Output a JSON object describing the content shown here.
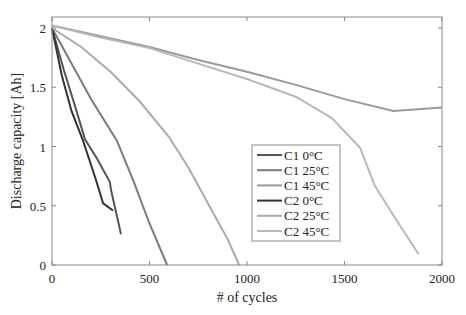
{
  "chart_data": {
    "type": "line",
    "title": "",
    "xlabel": "# of cycles",
    "ylabel": "Discharge capacity [Ah]",
    "xlim": [
      0,
      2000
    ],
    "ylim": [
      0,
      2.05
    ],
    "xticks": [
      0,
      500,
      1000,
      1500,
      2000
    ],
    "xtick_labels": [
      "0",
      "500",
      "1000",
      "1500",
      "2000"
    ],
    "yticks": [
      0,
      0.5,
      1,
      1.5,
      2
    ],
    "ytick_labels": [
      "0",
      "0.5",
      "1",
      "1.5",
      "2"
    ],
    "grid": false,
    "legend_position": "center-right inside axes",
    "series": [
      {
        "name": "C1 0°C",
        "color": "#555555",
        "x": [
          0,
          60,
          120,
          169,
          230,
          297,
          303,
          354
        ],
        "y": [
          2.0,
          1.65,
          1.33,
          1.06,
          0.9,
          0.7,
          0.63,
          0.26
        ]
      },
      {
        "name": "C1 25°C",
        "color": "#7a7a7a",
        "x": [
          0,
          100,
          200,
          333,
          420,
          500,
          590
        ],
        "y": [
          2.0,
          1.7,
          1.4,
          1.05,
          0.7,
          0.35,
          0.0
        ]
      },
      {
        "name": "C1 45°C",
        "color": "#9a9a9a",
        "x": [
          0,
          250,
          500,
          750,
          1000,
          1250,
          1500,
          1750,
          2000
        ],
        "y": [
          2.02,
          1.93,
          1.84,
          1.73,
          1.63,
          1.52,
          1.4,
          1.3,
          1.33
        ]
      },
      {
        "name": "C2 0°C",
        "color": "#333333",
        "x": [
          0,
          50,
          100,
          159,
          205,
          231,
          262,
          313
        ],
        "y": [
          2.0,
          1.6,
          1.3,
          1.05,
          0.82,
          0.69,
          0.52,
          0.46
        ]
      },
      {
        "name": "C2 25°C",
        "color": "#aaaaaa",
        "x": [
          0,
          150,
          300,
          450,
          600,
          700,
          800,
          900,
          960
        ],
        "y": [
          2.0,
          1.84,
          1.63,
          1.38,
          1.08,
          0.82,
          0.52,
          0.22,
          0.0
        ]
      },
      {
        "name": "C2 45°C",
        "color": "#b8b8b8",
        "x": [
          0,
          250,
          500,
          750,
          1000,
          1250,
          1435,
          1580,
          1655,
          1750,
          1880
        ],
        "y": [
          2.02,
          1.92,
          1.83,
          1.7,
          1.57,
          1.42,
          1.24,
          0.99,
          0.67,
          0.42,
          0.09
        ]
      }
    ]
  }
}
